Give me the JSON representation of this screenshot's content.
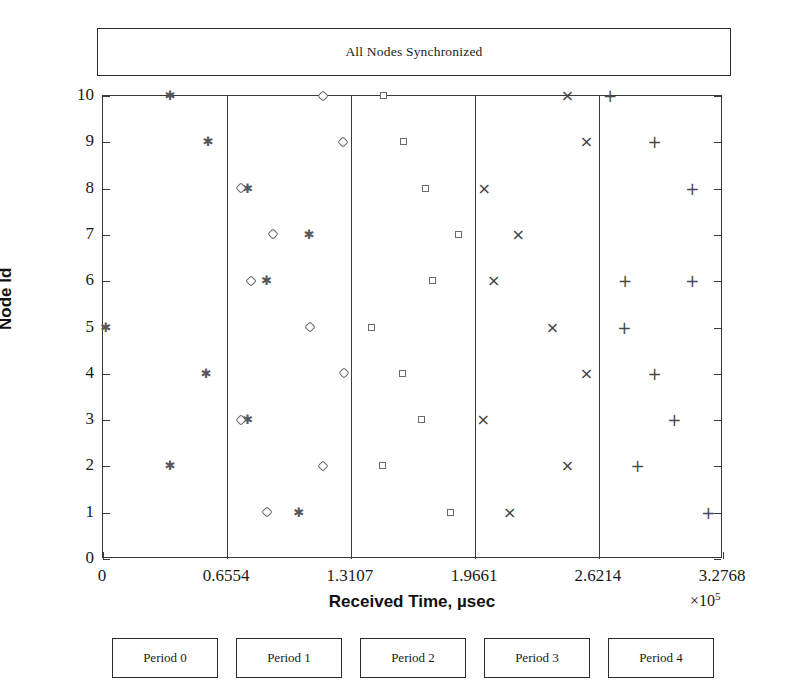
{
  "figure": {
    "title_box_label": "All Nodes Synchronized",
    "background": "#ffffff",
    "frame_color": "#3a3a3a",
    "marker_color": "#4b4b4b"
  },
  "axis": {
    "x_title": "Received Time, µsec",
    "y_title": "Node Id",
    "x_multiplier_symbol": "×",
    "x_multiplier_base": "10",
    "x_multiplier_exp": "5"
  },
  "period_boxes": [
    {
      "label": "Period 0"
    },
    {
      "label": "Period 1"
    },
    {
      "label": "Period 2"
    },
    {
      "label": "Period 3"
    },
    {
      "label": "Period 4"
    }
  ],
  "chart_data": {
    "type": "scatter",
    "title": "All Nodes Synchronized",
    "xlabel": "Received Time, µsec",
    "ylabel": "Node Id",
    "x_multiplier": 100000,
    "xlim": [
      0,
      327680
    ],
    "ylim": [
      0,
      10
    ],
    "grid": false,
    "legend": "none",
    "x_tick_labels": [
      "0",
      "0.6554",
      "1.3107",
      "1.9661",
      "2.6214",
      "3.2768"
    ],
    "x_tick_values": [
      0,
      65540,
      131070,
      196610,
      262140,
      327680
    ],
    "y_tick_labels": [
      "0",
      "1",
      "2",
      "3",
      "4",
      "5",
      "6",
      "7",
      "8",
      "9",
      "10"
    ],
    "y_tick_values": [
      0,
      1,
      2,
      3,
      4,
      5,
      6,
      7,
      8,
      9,
      10
    ],
    "period_boundaries": [
      0,
      65540,
      131070,
      196610,
      262140,
      327680
    ],
    "series": [
      {
        "name": "Period 0",
        "marker": "asterisk",
        "points": [
          {
            "node": 10,
            "x": 35500
          },
          {
            "node": 9,
            "x": 55600
          },
          {
            "node": 8,
            "x": 76500
          },
          {
            "node": 7,
            "x": 109000
          },
          {
            "node": 6,
            "x": 86500
          },
          {
            "node": 5,
            "x": 1500
          },
          {
            "node": 4,
            "x": 54600
          },
          {
            "node": 3,
            "x": 76500
          },
          {
            "node": 2,
            "x": 35500
          },
          {
            "node": 1,
            "x": 103500
          }
        ]
      },
      {
        "name": "Period 1",
        "marker": "diamond",
        "points": [
          {
            "node": 10,
            "x": 116500
          },
          {
            "node": 9,
            "x": 127000
          },
          {
            "node": 8,
            "x": 73000
          },
          {
            "node": 7,
            "x": 90000
          },
          {
            "node": 6,
            "x": 78500
          },
          {
            "node": 5,
            "x": 109500
          },
          {
            "node": 4,
            "x": 127500
          },
          {
            "node": 3,
            "x": 73000
          },
          {
            "node": 2,
            "x": 116500
          },
          {
            "node": 1,
            "x": 87000
          }
        ]
      },
      {
        "name": "Period 2",
        "marker": "square",
        "points": [
          {
            "node": 10,
            "x": 148500
          },
          {
            "node": 9,
            "x": 159000
          },
          {
            "node": 8,
            "x": 170500
          },
          {
            "node": 7,
            "x": 188000
          },
          {
            "node": 6,
            "x": 174500
          },
          {
            "node": 5,
            "x": 142000
          },
          {
            "node": 4,
            "x": 158500
          },
          {
            "node": 3,
            "x": 168500
          },
          {
            "node": 2,
            "x": 148000
          },
          {
            "node": 1,
            "x": 184000
          }
        ]
      },
      {
        "name": "Period 3",
        "marker": "cross",
        "points": [
          {
            "node": 10,
            "x": 245500
          },
          {
            "node": 9,
            "x": 255500
          },
          {
            "node": 8,
            "x": 201500
          },
          {
            "node": 7,
            "x": 219500
          },
          {
            "node": 6,
            "x": 206500
          },
          {
            "node": 5,
            "x": 237500
          },
          {
            "node": 4,
            "x": 255500
          },
          {
            "node": 3,
            "x": 201000
          },
          {
            "node": 2,
            "x": 245500
          },
          {
            "node": 1,
            "x": 215000
          }
        ]
      },
      {
        "name": "Period 4",
        "marker": "plus",
        "points": [
          {
            "node": 10,
            "x": 268000
          },
          {
            "node": 9,
            "x": 291500
          },
          {
            "node": 8,
            "x": 311500
          },
          {
            "node": 7,
            "x": 0
          },
          {
            "node": 6,
            "x": 276000
          },
          {
            "node": 5,
            "x": 275500
          },
          {
            "node": 4,
            "x": 291500
          },
          {
            "node": 3,
            "x": 302000
          },
          {
            "node": 2,
            "x": 282500
          },
          {
            "node": 1,
            "x": 320000
          }
        ]
      }
    ],
    "extra_points": [
      {
        "series": "Period 4",
        "node": 6,
        "x": 311500
      }
    ]
  }
}
